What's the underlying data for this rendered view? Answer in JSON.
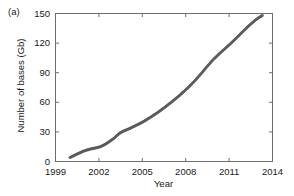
{
  "figure": {
    "panel_label": "(a)",
    "background_color": "#ffffff",
    "axis_color": "#6e6e6e",
    "text_color": "#1a1a1a"
  },
  "chart_data": {
    "type": "scatter",
    "title": "",
    "subtitle": "",
    "panel_label": "(a)",
    "xlabel": "Year",
    "ylabel": "Number of bases (Gb)",
    "xlim": [
      1999,
      2014
    ],
    "ylim": [
      0,
      150
    ],
    "xticks": [
      1999,
      2002,
      2005,
      2008,
      2011,
      2014
    ],
    "xtick_labels": [
      "1999",
      "2002",
      "2005",
      "2008",
      "2011",
      "2014"
    ],
    "yticks": [
      0,
      30,
      60,
      90,
      120,
      150
    ],
    "ytick_labels": [
      "0",
      "30",
      "60",
      "90",
      "120",
      "150"
    ],
    "grid": false,
    "legend": null,
    "marker": {
      "shape": "circle",
      "color": "#6b6b6b",
      "edge_color": "#4d4d4d",
      "size_px": 2.3
    },
    "series": [
      {
        "name": "Number of bases",
        "x": [
          2000.0,
          2000.17,
          2000.33,
          2000.5,
          2000.67,
          2000.83,
          2001.0,
          2001.17,
          2001.33,
          2001.5,
          2001.67,
          2001.83,
          2002.0,
          2002.17,
          2002.33,
          2002.5,
          2002.67,
          2002.83,
          2003.0,
          2003.17,
          2003.33,
          2003.5,
          2003.67,
          2003.83,
          2004.0,
          2004.17,
          2004.33,
          2004.5,
          2004.67,
          2004.83,
          2005.0,
          2005.17,
          2005.33,
          2005.5,
          2005.67,
          2005.83,
          2006.0,
          2006.17,
          2006.33,
          2006.5,
          2006.67,
          2006.83,
          2007.0,
          2007.17,
          2007.33,
          2007.5,
          2007.67,
          2007.83,
          2008.0,
          2008.17,
          2008.33,
          2008.5,
          2008.67,
          2008.83,
          2009.0,
          2009.17,
          2009.33,
          2009.5,
          2009.67,
          2009.83,
          2010.0,
          2010.17,
          2010.33,
          2010.5,
          2010.67,
          2010.83,
          2011.0,
          2011.17,
          2011.33,
          2011.5,
          2011.67,
          2011.83,
          2012.0,
          2012.17,
          2012.33,
          2012.5,
          2012.67,
          2012.83,
          2013.0,
          2013.17,
          2013.3
        ],
        "y": [
          4.0,
          5.2,
          6.4,
          7.6,
          8.7,
          9.8,
          10.8,
          11.6,
          12.3,
          12.9,
          13.4,
          13.9,
          14.5,
          15.4,
          16.6,
          18.0,
          19.6,
          21.3,
          23.0,
          25.2,
          27.4,
          29.3,
          30.6,
          31.6,
          32.6,
          33.7,
          34.9,
          36.1,
          37.3,
          38.5,
          39.8,
          41.2,
          42.7,
          44.2,
          45.8,
          47.4,
          49.0,
          50.7,
          52.5,
          54.3,
          56.2,
          58.1,
          60.0,
          62.0,
          64.0,
          66.0,
          68.2,
          70.4,
          72.6,
          74.9,
          77.3,
          79.8,
          82.4,
          85.1,
          87.9,
          90.8,
          93.7,
          96.6,
          99.4,
          102.1,
          104.6,
          107.0,
          109.3,
          111.5,
          113.7,
          115.9,
          118.1,
          120.4,
          122.7,
          125.1,
          127.5,
          130.0,
          132.4,
          134.8,
          137.1,
          139.3,
          141.4,
          143.4,
          145.2,
          146.9,
          148.0
        ]
      }
    ]
  }
}
